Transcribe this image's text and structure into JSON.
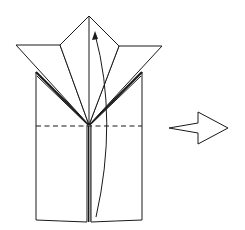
{
  "diagram": {
    "type": "origami-step",
    "stroke_color": "#1a1a1a",
    "background": "#ffffff",
    "elements": {
      "model": "folded-paper-model",
      "valley_fold_line": "dashed-horizontal-fold",
      "fold_arrow": "curved-arrow-up",
      "next_step_arrow": "hollow-arrow-right"
    }
  }
}
